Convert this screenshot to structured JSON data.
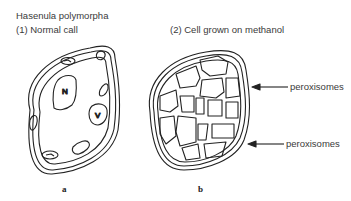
{
  "diagram": {
    "organism": "Hasenula polymorpha",
    "panels": [
      {
        "id": "a",
        "caption": "(1) Normal call",
        "sublabel": "a",
        "organelles": [
          {
            "label": "N"
          },
          {
            "label": "V"
          }
        ]
      },
      {
        "id": "b",
        "caption": "(2) Cell grown on methanol",
        "sublabel": "b"
      }
    ],
    "annotations": [
      {
        "text": "peroxisomes"
      },
      {
        "text": "peroxisomes"
      }
    ]
  }
}
